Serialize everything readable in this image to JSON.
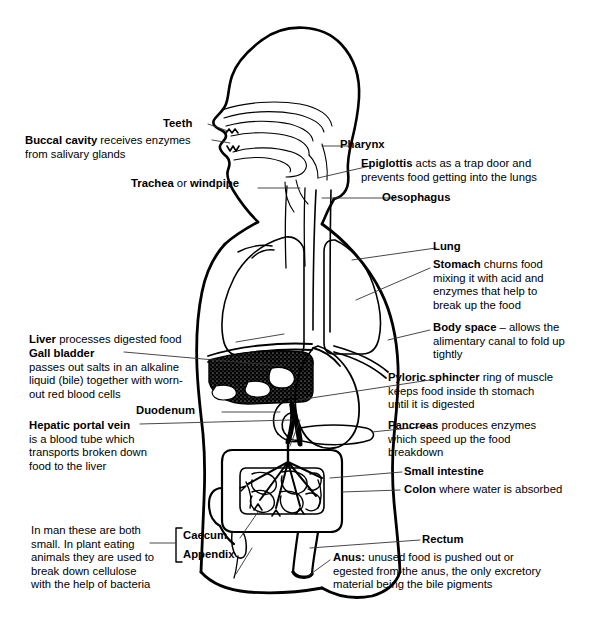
{
  "diagram": {
    "background_color": "#ffffff",
    "line_color": "#000000",
    "fill_organ_dark": "#000000"
  },
  "labels": {
    "teeth": {
      "term": "Teeth",
      "rest": ""
    },
    "buccal": {
      "term": "Buccal cavity",
      "rest": " receives enzymes",
      "line2": "from salivary glands"
    },
    "trachea": {
      "term": "Trachea",
      "rest": " or ",
      "term2": "windpipe"
    },
    "pharynx": {
      "term": "Pharynx",
      "rest": ""
    },
    "epiglottis": {
      "term": "Epiglottis",
      "rest": " acts as a trap door and",
      "line2": "prevents food getting into the lungs"
    },
    "oesophagus": {
      "term": "Oesophagus",
      "rest": ""
    },
    "lung": {
      "term": "Lung",
      "rest": ""
    },
    "stomach": {
      "term": "Stomach",
      "rest": " churns food",
      "line2": "mixing it with acid and",
      "line3": "enzymes that help to",
      "line4": "break up the food"
    },
    "body_space": {
      "term": "Body space",
      "rest": " – allows the",
      "line2": "alimentary canal to fold up",
      "line3": "tightly"
    },
    "pyloric": {
      "term": "Pyloric sphincter",
      "rest": " ring of muscle",
      "line2": "keeps food inside th stomach",
      "line3": "until it is digested"
    },
    "pancreas": {
      "term": "Pancreas",
      "rest": " produces enzymes",
      "line2": "which speed up the food",
      "line3": "breakdown"
    },
    "small_intestine": {
      "term": "Small intestine",
      "rest": ""
    },
    "colon": {
      "term": "Colon",
      "rest": " where water is absorbed"
    },
    "rectum": {
      "term": "Rectum",
      "rest": ""
    },
    "anus": {
      "term": "Anus:",
      "rest": " unused food is pushed out or",
      "line2": "egested from the anus, the only excretory",
      "line3": "material being the bile pigments"
    },
    "liver": {
      "term": "Liver",
      "rest": " processes digested food"
    },
    "gall_bladder": {
      "term": "Gall bladder",
      "rest": "",
      "line2": "passes out salts in an alkaline",
      "line3": "liquid (bile) together with worn-",
      "line4": "out red blood cells"
    },
    "duodenum": {
      "term": "Duodenum",
      "rest": ""
    },
    "hepatic": {
      "term": "Hepatic portal vein",
      "rest": "",
      "line2": "is a blood tube which",
      "line3": "transports broken down",
      "line4": "food to the liver"
    },
    "caecum": {
      "term": "Caecum",
      "rest": ""
    },
    "appendix": {
      "term": "Appendix",
      "rest": ""
    },
    "caecum_note": {
      "line1": "In man these are both",
      "line2": "small. In plant eating",
      "line3": "animals they are used to",
      "line4": "break down cellulose",
      "line5": "with the help of bacteria"
    }
  }
}
